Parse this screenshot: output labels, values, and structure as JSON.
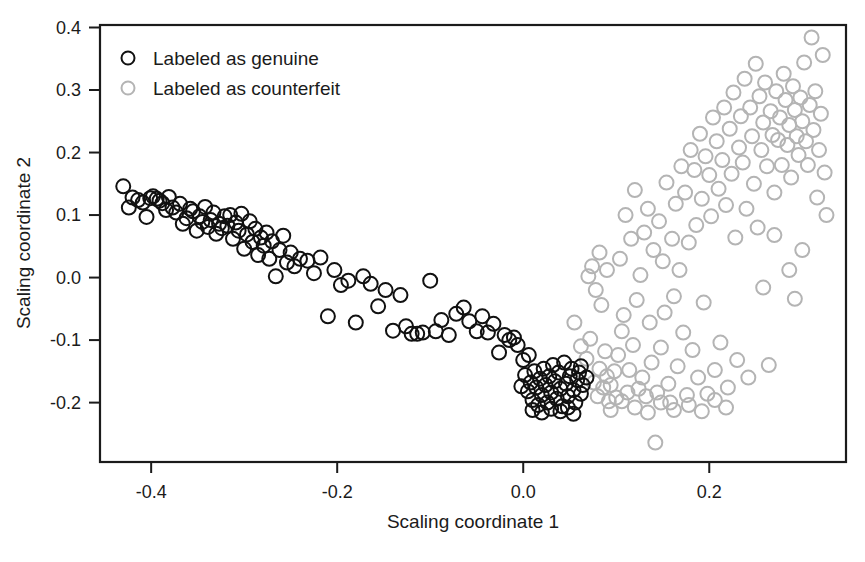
{
  "chart_data": {
    "type": "scatter",
    "title": "",
    "xlabel": "Scaling coordinate 1",
    "ylabel": "Scaling coordinate 2",
    "xlim": [
      -0.455,
      0.347
    ],
    "ylim": [
      -0.295,
      0.404
    ],
    "xticks": [
      -0.4,
      -0.2,
      0.0,
      0.2
    ],
    "xticklabels": [
      "-0.4",
      "-0.2",
      "0.0",
      "0.2"
    ],
    "yticks": [
      -0.2,
      -0.1,
      0.0,
      0.1,
      0.2,
      0.3,
      0.4
    ],
    "yticklabels": [
      "-0.2",
      "-0.1",
      "0.0",
      "0.1",
      "0.2",
      "0.3",
      "0.4"
    ],
    "grid": false,
    "box": true,
    "legend_position": "top-left",
    "marker": "open-circle",
    "marker_radius_px": 7,
    "series": [
      {
        "name": "Labeled as genuine",
        "color": "#111111",
        "legend_label": "Labeled as genuine",
        "points": [
          [
            -0.43,
            0.146
          ],
          [
            -0.424,
            0.112
          ],
          [
            -0.42,
            0.128
          ],
          [
            -0.414,
            0.124
          ],
          [
            -0.409,
            0.12
          ],
          [
            -0.405,
            0.097
          ],
          [
            -0.401,
            0.127
          ],
          [
            -0.398,
            0.13
          ],
          [
            -0.394,
            0.126
          ],
          [
            -0.391,
            0.123
          ],
          [
            -0.388,
            0.119
          ],
          [
            -0.384,
            0.108
          ],
          [
            -0.381,
            0.129
          ],
          [
            -0.377,
            0.112
          ],
          [
            -0.373,
            0.104
          ],
          [
            -0.369,
            0.118
          ],
          [
            -0.366,
            0.086
          ],
          [
            -0.362,
            0.095
          ],
          [
            -0.358,
            0.11
          ],
          [
            -0.355,
            0.106
          ],
          [
            -0.351,
            0.075
          ],
          [
            -0.348,
            0.098
          ],
          [
            -0.345,
            0.089
          ],
          [
            -0.342,
            0.113
          ],
          [
            -0.339,
            0.081
          ],
          [
            -0.336,
            0.092
          ],
          [
            -0.333,
            0.104
          ],
          [
            -0.33,
            0.07
          ],
          [
            -0.327,
            0.086
          ],
          [
            -0.324,
            0.079
          ],
          [
            -0.321,
            0.098
          ],
          [
            -0.318,
            0.083
          ],
          [
            -0.315,
            0.1
          ],
          [
            -0.312,
            0.062
          ],
          [
            -0.309,
            0.088
          ],
          [
            -0.306,
            0.075
          ],
          [
            -0.303,
            0.102
          ],
          [
            -0.3,
            0.046
          ],
          [
            -0.297,
            0.069
          ],
          [
            -0.294,
            0.09
          ],
          [
            -0.291,
            0.057
          ],
          [
            -0.288,
            0.078
          ],
          [
            -0.285,
            0.036
          ],
          [
            -0.282,
            0.064
          ],
          [
            -0.279,
            0.051
          ],
          [
            -0.276,
            0.072
          ],
          [
            -0.273,
            0.03
          ],
          [
            -0.27,
            0.058
          ],
          [
            -0.266,
            0.002
          ],
          [
            -0.262,
            0.044
          ],
          [
            -0.258,
            0.067
          ],
          [
            -0.254,
            0.024
          ],
          [
            -0.25,
            0.04
          ],
          [
            -0.246,
            0.018
          ],
          [
            -0.24,
            0.03
          ],
          [
            -0.232,
            0.027
          ],
          [
            -0.225,
            0.007
          ],
          [
            -0.218,
            0.032
          ],
          [
            -0.21,
            -0.062
          ],
          [
            -0.203,
            0.012
          ],
          [
            -0.196,
            -0.012
          ],
          [
            -0.188,
            -0.005
          ],
          [
            -0.18,
            -0.072
          ],
          [
            -0.172,
            0.002
          ],
          [
            -0.164,
            -0.01
          ],
          [
            -0.156,
            -0.046
          ],
          [
            -0.148,
            -0.02
          ],
          [
            -0.14,
            -0.085
          ],
          [
            -0.132,
            -0.028
          ],
          [
            -0.126,
            -0.078
          ],
          [
            -0.12,
            -0.09
          ],
          [
            -0.114,
            -0.09
          ],
          [
            -0.108,
            -0.088
          ],
          [
            -0.1,
            -0.005
          ],
          [
            -0.094,
            -0.086
          ],
          [
            -0.088,
            -0.068
          ],
          [
            -0.08,
            -0.092
          ],
          [
            -0.072,
            -0.058
          ],
          [
            -0.064,
            -0.048
          ],
          [
            -0.058,
            -0.07
          ],
          [
            -0.05,
            -0.086
          ],
          [
            -0.044,
            -0.062
          ],
          [
            -0.038,
            -0.088
          ],
          [
            -0.032,
            -0.074
          ],
          [
            -0.026,
            -0.12
          ],
          [
            -0.02,
            -0.092
          ],
          [
            -0.015,
            -0.1
          ],
          [
            -0.01,
            -0.096
          ],
          [
            -0.006,
            -0.108
          ],
          [
            0.002,
            -0.156
          ],
          [
            0.005,
            -0.182
          ],
          [
            0.008,
            -0.168
          ],
          [
            0.01,
            -0.196
          ],
          [
            0.012,
            -0.15
          ],
          [
            0.014,
            -0.176
          ],
          [
            0.016,
            -0.204
          ],
          [
            0.018,
            -0.162
          ],
          [
            0.02,
            -0.188
          ],
          [
            0.022,
            -0.146
          ],
          [
            0.024,
            -0.172
          ],
          [
            0.026,
            -0.2
          ],
          [
            0.028,
            -0.158
          ],
          [
            0.03,
            -0.184
          ],
          [
            0.032,
            -0.14
          ],
          [
            0.034,
            -0.166
          ],
          [
            0.036,
            -0.194
          ],
          [
            0.038,
            -0.152
          ],
          [
            0.04,
            -0.178
          ],
          [
            0.042,
            -0.206
          ],
          [
            0.044,
            -0.136
          ],
          [
            0.046,
            -0.17
          ],
          [
            0.048,
            -0.19
          ],
          [
            0.05,
            -0.158
          ],
          [
            0.052,
            -0.146
          ],
          [
            0.054,
            -0.18
          ],
          [
            0.056,
            -0.2
          ],
          [
            0.058,
            -0.164
          ],
          [
            0.06,
            -0.152
          ],
          [
            0.062,
            -0.186
          ],
          [
            0.064,
            -0.172
          ],
          [
            0.01,
            -0.212
          ],
          [
            0.02,
            -0.216
          ],
          [
            0.03,
            -0.21
          ],
          [
            0.04,
            -0.214
          ],
          [
            0.048,
            -0.208
          ],
          [
            0.054,
            -0.218
          ],
          [
            0.062,
            -0.142
          ],
          [
            0.068,
            -0.16
          ],
          [
            0.0,
            -0.132
          ],
          [
            0.006,
            -0.124
          ],
          [
            -0.002,
            -0.174
          ]
        ]
      },
      {
        "name": "Labeled as counterfeit",
        "color": "#b4b4b4",
        "legend_label": "Labeled as counterfeit",
        "points": [
          [
            0.055,
            -0.072
          ],
          [
            0.062,
            -0.11
          ],
          [
            0.068,
            -0.13
          ],
          [
            0.072,
            -0.098
          ],
          [
            0.076,
            -0.168
          ],
          [
            0.08,
            -0.19
          ],
          [
            0.082,
            -0.146
          ],
          [
            0.086,
            -0.176
          ],
          [
            0.088,
            -0.118
          ],
          [
            0.09,
            -0.158
          ],
          [
            0.092,
            -0.198
          ],
          [
            0.07,
            0.002
          ],
          [
            0.074,
            0.018
          ],
          [
            0.078,
            -0.02
          ],
          [
            0.082,
            0.04
          ],
          [
            0.084,
            -0.044
          ],
          [
            0.09,
            0.012
          ],
          [
            0.094,
            -0.172
          ],
          [
            0.098,
            -0.15
          ],
          [
            0.1,
            -0.192
          ],
          [
            0.102,
            -0.124
          ],
          [
            0.104,
            0.03
          ],
          [
            0.106,
            -0.086
          ],
          [
            0.108,
            -0.06
          ],
          [
            0.11,
            0.1
          ],
          [
            0.112,
            -0.184
          ],
          [
            0.114,
            -0.148
          ],
          [
            0.116,
            0.062
          ],
          [
            0.118,
            -0.108
          ],
          [
            0.12,
            0.14
          ],
          [
            0.122,
            -0.036
          ],
          [
            0.124,
            -0.178
          ],
          [
            0.126,
            0.004
          ],
          [
            0.128,
            -0.16
          ],
          [
            0.13,
            0.072
          ],
          [
            0.132,
            -0.19
          ],
          [
            0.134,
            0.11
          ],
          [
            0.136,
            -0.072
          ],
          [
            0.138,
            -0.136
          ],
          [
            0.14,
            0.044
          ],
          [
            0.142,
            -0.264
          ],
          [
            0.144,
            -0.184
          ],
          [
            0.146,
            0.09
          ],
          [
            0.148,
            -0.112
          ],
          [
            0.15,
            0.026
          ],
          [
            0.152,
            -0.056
          ],
          [
            0.154,
            0.152
          ],
          [
            0.156,
            -0.17
          ],
          [
            0.158,
            -0.2
          ],
          [
            0.16,
            0.062
          ],
          [
            0.162,
            -0.03
          ],
          [
            0.164,
            0.118
          ],
          [
            0.166,
            -0.142
          ],
          [
            0.168,
            0.012
          ],
          [
            0.17,
            0.178
          ],
          [
            0.172,
            -0.088
          ],
          [
            0.174,
            0.136
          ],
          [
            0.176,
            -0.188
          ],
          [
            0.178,
            0.056
          ],
          [
            0.18,
            0.204
          ],
          [
            0.182,
            -0.116
          ],
          [
            0.184,
            0.172
          ],
          [
            0.186,
            0.084
          ],
          [
            0.188,
            -0.16
          ],
          [
            0.19,
            0.23
          ],
          [
            0.192,
            0.126
          ],
          [
            0.194,
            -0.04
          ],
          [
            0.196,
            0.194
          ],
          [
            0.198,
            -0.186
          ],
          [
            0.2,
            0.164
          ],
          [
            0.202,
            0.098
          ],
          [
            0.204,
            0.256
          ],
          [
            0.206,
            -0.148
          ],
          [
            0.208,
            0.218
          ],
          [
            0.21,
            0.142
          ],
          [
            0.212,
            -0.104
          ],
          [
            0.214,
            0.188
          ],
          [
            0.216,
            0.272
          ],
          [
            0.218,
            0.116
          ],
          [
            0.22,
            -0.176
          ],
          [
            0.222,
            0.238
          ],
          [
            0.224,
            0.166
          ],
          [
            0.226,
            0.296
          ],
          [
            0.228,
            0.064
          ],
          [
            0.23,
            -0.132
          ],
          [
            0.232,
            0.208
          ],
          [
            0.234,
            0.258
          ],
          [
            0.236,
            0.184
          ],
          [
            0.238,
            0.318
          ],
          [
            0.24,
            0.11
          ],
          [
            0.242,
            -0.16
          ],
          [
            0.244,
            0.272
          ],
          [
            0.246,
            0.226
          ],
          [
            0.248,
            0.15
          ],
          [
            0.25,
            0.342
          ],
          [
            0.252,
            0.08
          ],
          [
            0.254,
            0.29
          ],
          [
            0.256,
            0.204
          ],
          [
            0.258,
            0.248
          ],
          [
            0.26,
            0.312
          ],
          [
            0.262,
            0.178
          ],
          [
            0.264,
            -0.14
          ],
          [
            0.266,
            0.266
          ],
          [
            0.268,
            0.228
          ],
          [
            0.27,
            0.136
          ],
          [
            0.272,
            0.298
          ],
          [
            0.274,
            0.22
          ],
          [
            0.276,
            0.256
          ],
          [
            0.278,
            0.18
          ],
          [
            0.28,
            0.326
          ],
          [
            0.282,
            0.284
          ],
          [
            0.284,
            0.212
          ],
          [
            0.286,
            0.244
          ],
          [
            0.288,
            0.16
          ],
          [
            0.29,
            0.306
          ],
          [
            0.292,
            0.268
          ],
          [
            0.294,
            0.226
          ],
          [
            0.296,
            0.196
          ],
          [
            0.298,
            0.288
          ],
          [
            0.3,
            0.25
          ],
          [
            0.302,
            0.344
          ],
          [
            0.304,
            0.218
          ],
          [
            0.306,
            0.18
          ],
          [
            0.308,
            0.276
          ],
          [
            0.31,
            0.384
          ],
          [
            0.312,
            0.236
          ],
          [
            0.314,
            0.298
          ],
          [
            0.316,
            0.128
          ],
          [
            0.318,
            0.204
          ],
          [
            0.32,
            0.262
          ],
          [
            0.322,
            0.356
          ],
          [
            0.324,
            0.168
          ],
          [
            0.326,
            0.1
          ],
          [
            0.3,
            0.044
          ],
          [
            0.286,
            0.012
          ],
          [
            0.292,
            -0.034
          ],
          [
            0.27,
            0.068
          ],
          [
            0.258,
            -0.016
          ],
          [
            0.12,
            -0.208
          ],
          [
            0.134,
            -0.216
          ],
          [
            0.148,
            -0.2
          ],
          [
            0.162,
            -0.212
          ],
          [
            0.178,
            -0.204
          ],
          [
            0.192,
            -0.214
          ],
          [
            0.206,
            -0.196
          ],
          [
            0.218,
            -0.208
          ],
          [
            0.094,
            -0.212
          ],
          [
            0.106,
            -0.198
          ]
        ]
      }
    ]
  },
  "legend": {
    "entries": [
      {
        "label": "Labeled as genuine",
        "marker": "open-circle",
        "color": "#111111"
      },
      {
        "label": "Labeled as counterfeit",
        "marker": "open-circle",
        "color": "#b4b4b4"
      }
    ]
  },
  "axes": {
    "x_label": "Scaling coordinate 1",
    "y_label": "Scaling coordinate 2"
  }
}
